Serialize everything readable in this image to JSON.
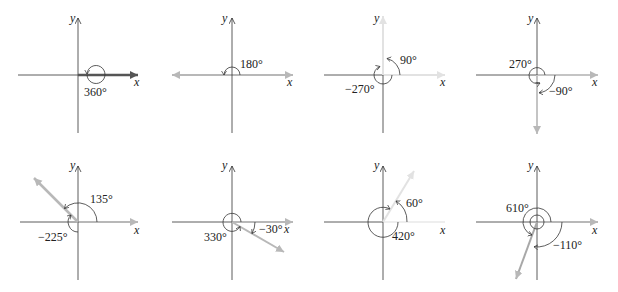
{
  "figure": {
    "axis_labels": {
      "x": "x",
      "y": "y"
    },
    "colors": {
      "axis": "#333333",
      "terminal_side_dark": "#555555",
      "terminal_side_light": "#b8b8b8",
      "terminal_side_faint": "#e2e2e2",
      "arc": "#333333",
      "text": "#222222"
    },
    "panels": [
      {
        "id": "p1",
        "terminal_angle_deg": 0,
        "angles": [
          {
            "label": "360°"
          }
        ]
      },
      {
        "id": "p2",
        "terminal_angle_deg": 180,
        "angles": [
          {
            "label": "180°"
          }
        ]
      },
      {
        "id": "p3",
        "terminal_angle_deg": 90,
        "angles": [
          {
            "label": "90°"
          },
          {
            "label": "−270°"
          }
        ]
      },
      {
        "id": "p4",
        "terminal_angle_deg": -90,
        "angles": [
          {
            "label": "270°"
          },
          {
            "label": "−90°"
          }
        ]
      },
      {
        "id": "p5",
        "terminal_angle_deg": 135,
        "angles": [
          {
            "label": "135°"
          },
          {
            "label": "−225°"
          }
        ]
      },
      {
        "id": "p6",
        "terminal_angle_deg": -30,
        "angles": [
          {
            "label": "330°"
          },
          {
            "label": "−30°"
          }
        ]
      },
      {
        "id": "p7",
        "terminal_angle_deg": 60,
        "angles": [
          {
            "label": "60°"
          },
          {
            "label": "420°"
          }
        ]
      },
      {
        "id": "p8",
        "terminal_angle_deg": -110,
        "angles": [
          {
            "label": "610°"
          },
          {
            "label": "−110°"
          }
        ]
      }
    ]
  }
}
